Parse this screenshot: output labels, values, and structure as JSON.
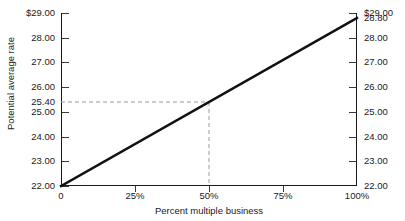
{
  "chart_data": {
    "type": "line",
    "title": "",
    "xlabel": "Percent multiple business",
    "ylabel": "Potential average rate",
    "xlim": [
      0,
      100
    ],
    "ylim": [
      22.0,
      29.0
    ],
    "grid": false,
    "legend": null,
    "x_tick_labels": [
      "0",
      "25%",
      "50%",
      "75%",
      "100%"
    ],
    "x_tick_values": [
      0,
      25,
      50,
      75,
      100
    ],
    "y_tick_labels_left": [
      "$29.00",
      "28.00",
      "27.00",
      "26.00",
      "25.40",
      "25.00",
      "24.00",
      "23.00",
      "22.00"
    ],
    "y_tick_values_left": [
      29.0,
      28.0,
      27.0,
      26.0,
      25.4,
      25.0,
      24.0,
      23.0,
      22.0
    ],
    "y_tick_labels_right": [
      "$29.00",
      "28.80",
      "28.00",
      "27.00",
      "26.00",
      "25.00",
      "24.00",
      "23.00",
      "22.00"
    ],
    "y_tick_values_right": [
      29.0,
      28.8,
      28.0,
      27.0,
      26.0,
      25.0,
      24.0,
      23.0,
      22.0
    ],
    "series": [
      {
        "name": "Potential average rate",
        "x": [
          0,
          100
        ],
        "values": [
          22.0,
          28.8
        ],
        "style": "solid",
        "color": "#111111"
      }
    ],
    "annotations": [
      {
        "type": "reference-lines",
        "style": "dashed",
        "color": "#9a9a9a",
        "x": 50,
        "y": 25.4,
        "label_x": "50%",
        "label_y": "25.40"
      }
    ]
  }
}
